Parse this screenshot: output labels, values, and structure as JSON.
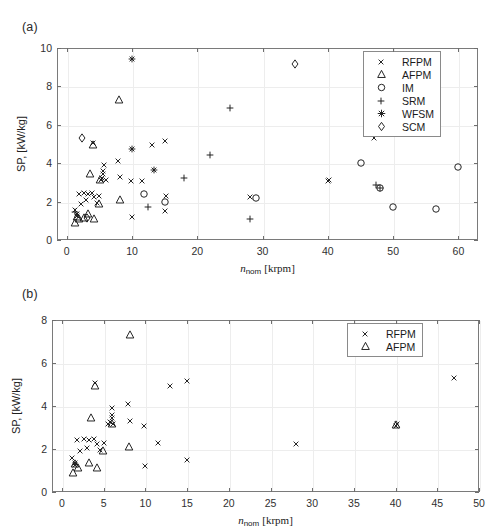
{
  "figure": {
    "panel_a_label": "(a)",
    "panel_b_label": "(b)"
  },
  "chart_data": [
    {
      "type": "scatter",
      "panel": "(a)",
      "title": "",
      "xlabel": "n_nom [krpm]",
      "ylabel": "SP, [kW/kg]",
      "xlim": [
        -1.5,
        63
      ],
      "ylim": [
        0,
        10
      ],
      "xticks": [
        0,
        10,
        20,
        30,
        40,
        50,
        60
      ],
      "yticks": [
        0,
        2,
        4,
        6,
        8,
        10
      ],
      "grid": true,
      "legend_position": "upper right",
      "series": [
        {
          "name": "RFPM",
          "marker": "x",
          "points": [
            [
              1.2,
              1.55
            ],
            [
              1.5,
              1.35
            ],
            [
              1.6,
              1.25
            ],
            [
              1.8,
              2.4
            ],
            [
              2.2,
              1.9
            ],
            [
              2.6,
              2.45
            ],
            [
              3.0,
              2.1
            ],
            [
              3.2,
              2.4
            ],
            [
              3.8,
              2.45
            ],
            [
              4.0,
              5.05
            ],
            [
              4.2,
              2.25
            ],
            [
              4.6,
              1.95
            ],
            [
              5.0,
              2.3
            ],
            [
              5.2,
              3.15
            ],
            [
              5.4,
              3.25
            ],
            [
              5.5,
              3.45
            ],
            [
              5.6,
              3.6
            ],
            [
              5.7,
              3.9
            ],
            [
              6.0,
              3.15
            ],
            [
              7.9,
              4.1
            ],
            [
              8.2,
              3.3
            ],
            [
              9.8,
              3.05
            ],
            [
              10.0,
              1.2
            ],
            [
              11.5,
              3.05
            ],
            [
              13.0,
              4.95
            ],
            [
              15.0,
              5.15
            ],
            [
              15.0,
              1.5
            ],
            [
              15.2,
              2.3
            ],
            [
              28.0,
              2.25
            ],
            [
              40.0,
              3.05
            ],
            [
              40.2,
              3.15
            ],
            [
              47.0,
              5.3
            ]
          ]
        },
        {
          "name": "AFPM",
          "marker": "triangle",
          "points": [
            [
              1.3,
              0.9
            ],
            [
              1.6,
              1.2
            ],
            [
              1.9,
              1.1
            ],
            [
              2.6,
              1.15
            ],
            [
              3.2,
              1.35
            ],
            [
              3.5,
              3.45
            ],
            [
              4.0,
              4.95
            ],
            [
              4.2,
              1.1
            ],
            [
              4.9,
              1.9
            ],
            [
              5.1,
              3.15
            ],
            [
              8.0,
              7.3
            ],
            [
              8.2,
              2.1
            ]
          ]
        },
        {
          "name": "IM",
          "marker": "circle",
          "points": [
            [
              11.9,
              2.4
            ],
            [
              15.0,
              2.0
            ],
            [
              29.0,
              2.2
            ],
            [
              45.0,
              4.0
            ],
            [
              48.0,
              2.7
            ],
            [
              50.0,
              1.7
            ],
            [
              56.5,
              1.6
            ],
            [
              60.0,
              3.8
            ]
          ]
        },
        {
          "name": "SRM",
          "marker": "plus",
          "points": [
            [
              1.2,
              1.45
            ],
            [
              12.5,
              1.7
            ],
            [
              18.0,
              3.25
            ],
            [
              22.0,
              4.45
            ],
            [
              25.0,
              6.9
            ],
            [
              28.0,
              1.1
            ],
            [
              47.3,
              2.85
            ],
            [
              48.0,
              2.7
            ]
          ]
        },
        {
          "name": "WFSM",
          "marker": "asterisk",
          "points": [
            [
              10.0,
              9.45
            ],
            [
              10.0,
              4.75
            ],
            [
              13.3,
              3.65
            ]
          ]
        },
        {
          "name": "SCM",
          "marker": "diamond",
          "points": [
            [
              2.4,
              5.3
            ],
            [
              3.1,
              1.15
            ],
            [
              35.0,
              9.15
            ]
          ]
        }
      ]
    },
    {
      "type": "scatter",
      "panel": "(b)",
      "title": "",
      "xlabel": "n_nom [krpm]",
      "ylabel": "SP, [kW/kg]",
      "xlim": [
        -1.2,
        50
      ],
      "ylim": [
        0,
        8
      ],
      "xticks": [
        0,
        5,
        10,
        15,
        20,
        25,
        30,
        35,
        40,
        45,
        50
      ],
      "yticks": [
        0,
        2,
        4,
        6,
        8
      ],
      "grid": true,
      "legend_position": "upper right",
      "series": [
        {
          "name": "RFPM",
          "marker": "x",
          "points": [
            [
              1.2,
              1.6
            ],
            [
              1.5,
              1.35
            ],
            [
              1.6,
              1.25
            ],
            [
              1.8,
              2.4
            ],
            [
              2.2,
              1.9
            ],
            [
              2.6,
              2.45
            ],
            [
              3.0,
              2.05
            ],
            [
              3.2,
              2.4
            ],
            [
              3.8,
              2.45
            ],
            [
              4.0,
              5.05
            ],
            [
              4.2,
              2.25
            ],
            [
              4.6,
              1.95
            ],
            [
              5.0,
              2.3
            ],
            [
              5.5,
              3.15
            ],
            [
              5.8,
              3.25
            ],
            [
              6.0,
              3.45
            ],
            [
              6.0,
              3.6
            ],
            [
              6.0,
              3.9
            ],
            [
              6.1,
              3.15
            ],
            [
              7.9,
              4.1
            ],
            [
              8.2,
              3.3
            ],
            [
              9.8,
              3.05
            ],
            [
              10.0,
              1.2
            ],
            [
              11.5,
              2.3
            ],
            [
              13.0,
              4.95
            ],
            [
              15.0,
              5.15
            ],
            [
              15.0,
              1.5
            ],
            [
              28.0,
              2.25
            ],
            [
              40.0,
              3.05
            ],
            [
              40.2,
              3.15
            ],
            [
              47.0,
              5.3
            ]
          ]
        },
        {
          "name": "AFPM",
          "marker": "triangle",
          "points": [
            [
              1.3,
              0.9
            ],
            [
              1.6,
              1.3
            ],
            [
              1.9,
              1.1
            ],
            [
              3.2,
              1.35
            ],
            [
              4.0,
              4.95
            ],
            [
              4.2,
              1.1
            ],
            [
              3.5,
              3.45
            ],
            [
              4.9,
              1.9
            ],
            [
              6.0,
              3.15
            ],
            [
              8.2,
              7.3
            ],
            [
              8.0,
              2.1
            ],
            [
              40.0,
              3.1
            ]
          ]
        }
      ]
    }
  ],
  "panel_a": {
    "label": "(a)",
    "xlabel_main": "n",
    "xlabel_sub": "nom",
    "xlabel_unit": "[krpm]",
    "ylabel": "SP, [kW/kg]",
    "xticklabels": [
      "0",
      "10",
      "20",
      "30",
      "40",
      "50",
      "60"
    ],
    "yticklabels": [
      "0",
      "2",
      "4",
      "6",
      "8",
      "10"
    ],
    "legend": {
      "items": [
        {
          "symbol": "x-marker",
          "label": "RFPM"
        },
        {
          "symbol": "triangle-marker",
          "label": "AFPM"
        },
        {
          "symbol": "circle-marker",
          "label": "IM"
        },
        {
          "symbol": "plus-marker",
          "label": "SRM"
        },
        {
          "symbol": "asterisk-marker",
          "label": "WFSM"
        },
        {
          "symbol": "diamond-marker",
          "label": "SCM"
        }
      ]
    }
  },
  "panel_b": {
    "label": "(b)",
    "xlabel_main": "n",
    "xlabel_sub": "nom",
    "xlabel_unit": "[krpm]",
    "ylabel": "SP, [kW/kg]",
    "xticklabels": [
      "0",
      "5",
      "10",
      "15",
      "20",
      "25",
      "30",
      "35",
      "40",
      "45",
      "50"
    ],
    "yticklabels": [
      "0",
      "2",
      "4",
      "6",
      "8"
    ],
    "legend": {
      "items": [
        {
          "symbol": "x-marker",
          "label": "RFPM"
        },
        {
          "symbol": "triangle-marker",
          "label": "AFPM"
        }
      ]
    }
  },
  "style": {
    "marker_color": "#1a1a1a",
    "grid_color": "#ededed",
    "axis_color": "#7a7a7a"
  }
}
